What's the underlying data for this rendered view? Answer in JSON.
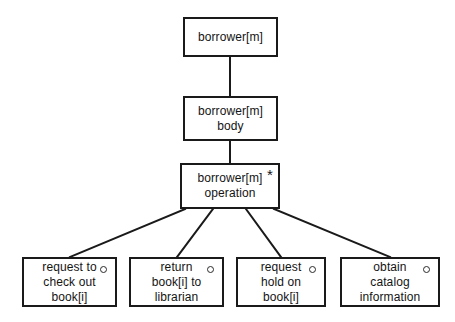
{
  "diagram": {
    "background_color": "#ffffff",
    "line_color": "#1a1a1a",
    "text_color": "#141414",
    "nodes": [
      {
        "id": "root",
        "name": "borrower-module",
        "lines": [
          "borrower[m]"
        ],
        "marker": "",
        "x": 183,
        "y": 17,
        "w": 95,
        "h": 40
      },
      {
        "id": "body",
        "name": "borrower-body",
        "lines": [
          "borrower[m]",
          "body"
        ],
        "marker": "",
        "x": 183,
        "y": 96,
        "w": 95,
        "h": 45
      },
      {
        "id": "operation",
        "name": "borrower-operation",
        "lines": [
          "borrower[m]",
          "operation"
        ],
        "marker": "*",
        "x": 180,
        "y": 163,
        "w": 100,
        "h": 46
      },
      {
        "id": "leaf1",
        "name": "request-to-check-out-book",
        "lines": [
          "request to",
          "check out",
          "book[i]"
        ],
        "marker": "circle",
        "x": 22,
        "y": 257,
        "w": 95,
        "h": 50
      },
      {
        "id": "leaf2",
        "name": "return-book-to-librarian",
        "lines": [
          "return",
          "book[i] to",
          "librarian"
        ],
        "marker": "circle",
        "x": 129,
        "y": 257,
        "w": 95,
        "h": 50
      },
      {
        "id": "leaf3",
        "name": "request-hold-on-book",
        "lines": [
          "request",
          "hold on",
          "book[i]"
        ],
        "marker": "circle",
        "x": 236,
        "y": 257,
        "w": 90,
        "h": 50
      },
      {
        "id": "leaf4",
        "name": "obtain-catalog-information",
        "lines": [
          "obtain",
          "catalog",
          "information"
        ],
        "marker": "circle",
        "x": 340,
        "y": 257,
        "w": 100,
        "h": 50
      }
    ],
    "edges": [
      {
        "name": "edge-root-to-body",
        "x1": 230,
        "y1": 57,
        "x2": 230,
        "y2": 96
      },
      {
        "name": "edge-body-to-operation",
        "x1": 230,
        "y1": 141,
        "x2": 230,
        "y2": 163
      },
      {
        "name": "edge-operation-to-leaf1",
        "x1": 185,
        "y1": 209,
        "x2": 70,
        "y2": 257
      },
      {
        "name": "edge-operation-to-leaf2",
        "x1": 213,
        "y1": 209,
        "x2": 177,
        "y2": 257
      },
      {
        "name": "edge-operation-to-leaf3",
        "x1": 246,
        "y1": 209,
        "x2": 281,
        "y2": 257
      },
      {
        "name": "edge-operation-to-leaf4",
        "x1": 274,
        "y1": 209,
        "x2": 390,
        "y2": 257
      }
    ]
  }
}
